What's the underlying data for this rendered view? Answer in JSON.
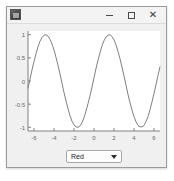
{
  "window": {
    "title": "",
    "icon": "matlab-app-icon",
    "controls": {
      "minimize": "−",
      "maximize": "□",
      "close": "✕"
    }
  },
  "dropdown": {
    "name": "color-select",
    "value": "Red",
    "arrow_icon": "chevron-down-icon",
    "options": [
      "Red"
    ]
  },
  "chart_data": {
    "type": "line",
    "title": "",
    "xlabel": "",
    "ylabel": "",
    "xlim": [
      -6.6,
      6.6
    ],
    "ylim": [
      -1.08,
      1.08
    ],
    "xticks": [
      -6,
      -4,
      -2,
      0,
      2,
      4,
      6
    ],
    "xticklabels": [
      "-6",
      "-4",
      "-2",
      "0",
      "2",
      "4",
      "6"
    ],
    "yticks": [
      -1,
      -0.5,
      0,
      0.5,
      1
    ],
    "yticklabels": [
      "-1",
      "-0.5",
      "0",
      "0.5",
      "1"
    ],
    "grid": false,
    "legend": null,
    "line_color": "#7f7f7f",
    "series": [
      {
        "name": "cos(x - 1.6)",
        "x": [
          -6.6,
          -6.4,
          -6.2,
          -6.0,
          -5.8,
          -5.6,
          -5.4,
          -5.2,
          -5.0,
          -4.8,
          -4.6,
          -4.4,
          -4.2,
          -4.0,
          -3.8,
          -3.6,
          -3.4,
          -3.2,
          -3.0,
          -2.8,
          -2.6,
          -2.4,
          -2.2,
          -2.0,
          -1.8,
          -1.6,
          -1.4,
          -1.2,
          -1.0,
          -0.8,
          -0.6,
          -0.4,
          -0.2,
          0.0,
          0.2,
          0.4,
          0.6,
          0.8,
          1.0,
          1.2,
          1.4,
          1.6,
          1.8,
          2.0,
          2.2,
          2.4,
          2.6,
          2.8,
          3.0,
          3.2,
          3.4,
          3.6,
          3.8,
          4.0,
          4.2,
          4.4,
          4.6,
          4.8,
          5.0,
          5.2,
          5.4,
          5.6,
          5.8,
          6.0,
          6.2,
          6.4,
          6.6
        ],
        "y": [
          -0.16,
          0.04,
          0.24,
          0.42,
          0.59,
          0.74,
          0.86,
          0.94,
          0.99,
          1.0,
          0.97,
          0.9,
          0.8,
          0.67,
          0.51,
          0.34,
          0.15,
          -0.05,
          -0.25,
          -0.43,
          -0.6,
          -0.75,
          -0.87,
          -0.95,
          -0.99,
          -1.0,
          -0.97,
          -0.9,
          -0.79,
          -0.65,
          -0.49,
          -0.32,
          -0.13,
          0.07,
          0.27,
          0.45,
          0.61,
          0.76,
          0.87,
          0.95,
          0.99,
          1.0,
          0.96,
          0.89,
          0.78,
          0.64,
          0.48,
          0.3,
          0.11,
          -0.09,
          -0.29,
          -0.47,
          -0.63,
          -0.77,
          -0.88,
          -0.96,
          -0.99,
          -0.99,
          -0.96,
          -0.88,
          -0.77,
          -0.62,
          -0.45,
          -0.27,
          -0.08,
          0.12,
          0.31
        ]
      }
    ]
  }
}
